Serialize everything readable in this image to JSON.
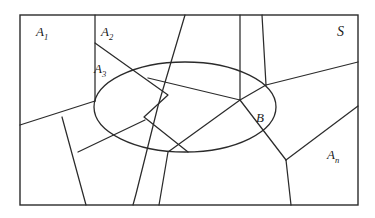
{
  "figure": {
    "background_color": "#ffffff",
    "stroke_color": "#2b2b2b",
    "text_color": "#1a1a1a",
    "border": {
      "x": 20,
      "y": 15,
      "width": 338,
      "height": 190,
      "stroke_width": 1.4
    },
    "ellipse": {
      "cx": 185,
      "cy": 107,
      "rx": 91,
      "ry": 45,
      "stroke_width": 1.3
    },
    "labels": [
      {
        "id": "A1",
        "base": "A",
        "sub": "1",
        "x": 36,
        "y": 36,
        "sub_dx": 8,
        "sub_dy": 4
      },
      {
        "id": "A2",
        "base": "A",
        "sub": "2",
        "x": 101,
        "y": 36,
        "sub_dx": 8,
        "sub_dy": 4
      },
      {
        "id": "A3",
        "base": "A",
        "sub": "3",
        "x": 94,
        "y": 73,
        "sub_dx": 8,
        "sub_dy": 4
      },
      {
        "id": "An",
        "base": "A",
        "sub": "n",
        "x": 327,
        "y": 159,
        "sub_dx": 8,
        "sub_dy": 4
      },
      {
        "id": "B",
        "base": "B",
        "sub": "",
        "x": 256,
        "y": 122,
        "sub_dx": 0,
        "sub_dy": 0
      },
      {
        "id": "S",
        "base": "S",
        "sub": "",
        "x": 338,
        "y": 36,
        "sub_dx": 0,
        "sub_dy": 0
      }
    ],
    "partition_lines": [
      {
        "name": "a1-right-vertical",
        "points": "95,15 95,101"
      },
      {
        "name": "a1-lower-diagonal",
        "points": "95,101 20,125"
      },
      {
        "name": "a2-a3-diagonal",
        "points": "95,43 168,95 144,117 188,152"
      },
      {
        "name": "top-slant-left",
        "points": "185,15 158,106"
      },
      {
        "name": "top-slant-left-lower",
        "points": "158,106 136,194"
      },
      {
        "name": "center-quad-left",
        "points": "240,15 240,100"
      },
      {
        "name": "quad-bottom-edge",
        "points": "148,78 240,100"
      },
      {
        "name": "quad-right-edge",
        "points": "240,100 265,85"
      },
      {
        "name": "quad-top-right",
        "points": "265,85 262,15"
      },
      {
        "name": "right-upper-boundary",
        "points": "265,85 358,62"
      },
      {
        "name": "center-fan-down-left",
        "points": "240,100 168,152 159,205"
      },
      {
        "name": "center-fan-down-right",
        "points": "240,100 286,160"
      },
      {
        "name": "y-junction-stem",
        "points": "286,160 290,205"
      },
      {
        "name": "y-junction-up-right",
        "points": "286,160 358,105"
      },
      {
        "name": "lower-left-branch",
        "points": "62,117 86,205"
      },
      {
        "name": "lower-left-to-ellipse",
        "points": "86,158 140,130"
      }
    ]
  }
}
